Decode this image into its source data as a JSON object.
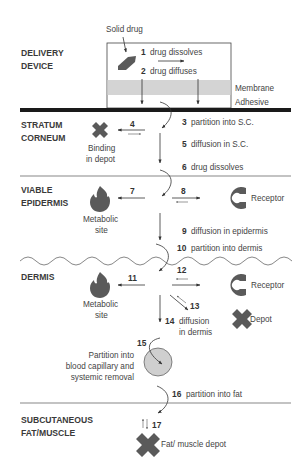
{
  "colors": {
    "background": "#ffffff",
    "ink": "#333333",
    "shape_fill": "#5a5a5a",
    "membrane": "#d4d4d4",
    "capillary": "#cfcfcf",
    "skin_surface": "#1a1a1a",
    "layer_line": "#555555"
  },
  "layers": [
    {
      "id": "delivery",
      "line1": "DELIVERY",
      "line2": "DEVICE"
    },
    {
      "id": "stratum",
      "line1": "STRATUM",
      "line2": "CORNEUM"
    },
    {
      "id": "viable",
      "line1": "VIABLE",
      "line2": "EPIDERMIS"
    },
    {
      "id": "dermis",
      "line1": "DERMIS",
      "line2": ""
    },
    {
      "id": "subcut",
      "line1": "SUBCUTANEOUS",
      "line2": "FAT/MUSCLE"
    }
  ],
  "device": {
    "solid_drug_label": "Solid drug",
    "membrane_label": "Membrane",
    "adhesive_label": "Adhesive"
  },
  "steps": [
    {
      "num": "1",
      "text": "drug dissolves"
    },
    {
      "num": "2",
      "text": "drug diffuses"
    },
    {
      "num": "3",
      "text": "partition into S.C."
    },
    {
      "num": "4",
      "text": ""
    },
    {
      "num": "5",
      "text": "diffusion in S.C."
    },
    {
      "num": "6",
      "text": "drug dissolves"
    },
    {
      "num": "7",
      "text": ""
    },
    {
      "num": "8",
      "text": ""
    },
    {
      "num": "9",
      "text": "diffusion in epidermis"
    },
    {
      "num": "10",
      "text": "partition into dermis"
    },
    {
      "num": "11",
      "text": ""
    },
    {
      "num": "12",
      "text": ""
    },
    {
      "num": "13",
      "text": ""
    },
    {
      "num": "14",
      "text": "diffusion"
    },
    {
      "num": "15",
      "text": ""
    },
    {
      "num": "16",
      "text": "partition into fat"
    },
    {
      "num": "17",
      "text": ""
    }
  ],
  "labels": {
    "binding_line1": "Binding",
    "binding_line2": "in depot",
    "metabolic1_line1": "Metabolic",
    "metabolic1_line2": "site",
    "receptor1": "Receptor",
    "metabolic2_line1": "Metabolic",
    "metabolic2_line2": "site",
    "receptor2": "Receptor",
    "depot": "Depot",
    "diffusion_dermis_line2": "in dermis",
    "capillary_line1": "Partition into",
    "capillary_line2": "blood capillary and",
    "capillary_line3": "systemic removal",
    "fat_depot": "Fat/ muscle depot"
  }
}
